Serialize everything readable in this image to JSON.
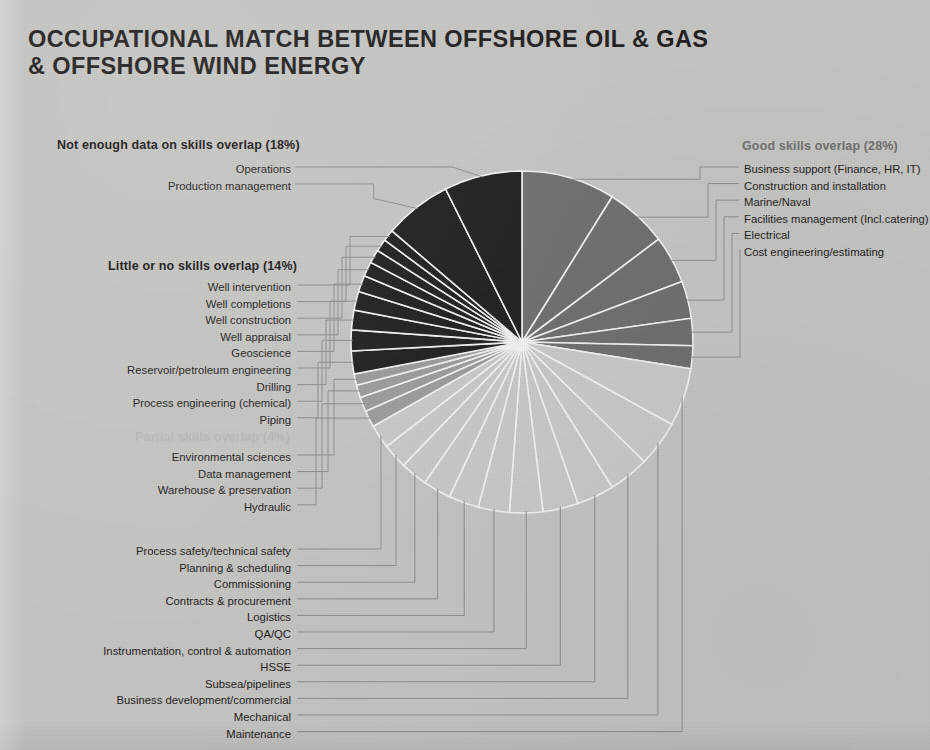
{
  "title": {
    "line1": "OCCUPATIONAL MATCH BETWEEN OFFSHORE OIL & GAS",
    "line2": "& OFFSHORE WIND ENERGY"
  },
  "colors": {
    "background": "#c4c4c2",
    "not_enough_data": "#1e1c1c",
    "good_overlap": "#6e6e6e",
    "partial_overlap": "#9b9b9a",
    "little_or_no": "#1e1c1c",
    "default_slice": "#c9c9c7",
    "slice_divider": "#f2f2f0",
    "leader_line": "#8d8d8b",
    "title_text": "#1d1b1b"
  },
  "groups": {
    "not_enough_data": {
      "heading": "Not enough data on skills overlap (18%)",
      "percent": 18,
      "items": [
        "Operations",
        "Production management"
      ]
    },
    "little_or_no": {
      "heading": "Little or no skills overlap (14%)",
      "percent": 14,
      "items": [
        "Well intervention",
        "Well completions",
        "Well construction",
        "Well appraisal",
        "Geoscience",
        "Reservoir/petroleum engineering",
        "Drilling",
        "Process engineering (chemical)",
        "Piping"
      ]
    },
    "partial": {
      "heading": "Partial skills overlap (4%)",
      "percent": 4,
      "items": [
        "Environmental sciences",
        "Data management",
        "Warehouse & preservation",
        "Hydraulic"
      ]
    },
    "good": {
      "heading": "Good skills overlap (28%)",
      "percent": 28,
      "items": [
        "Business support (Finance, HR, IT)",
        "Construction and installation",
        "Marine/Naval",
        "Facilities management (Incl.catering)",
        "Electrical",
        "Cost engineering/estimating"
      ]
    },
    "bottom": {
      "heading": "",
      "items": [
        "Process safety/technical safety",
        "Planning & scheduling",
        "Commissioning",
        "Contracts & procurement",
        "Logistics",
        "QA/QC",
        "Instrumentation, control & automation",
        "HSSE",
        "Subsea/pipelines",
        "Business development/commercial",
        "Mechanical",
        "Maintenance"
      ]
    }
  },
  "chart_data": {
    "type": "pie",
    "title": "Occupational match between offshore oil & gas & offshore wind energy",
    "legend_position": "around",
    "grid": false,
    "center": [
      522,
      342
    ],
    "radius": 171,
    "start_angle_deg": -90,
    "direction": "clockwise",
    "categories": [
      "Business support (Finance, HR, IT)",
      "Construction and installation",
      "Marine/Naval",
      "Facilities management (Incl.catering)",
      "Electrical",
      "Cost engineering/estimating",
      "Maintenance",
      "Mechanical",
      "Business development/commercial",
      "Subsea/pipelines",
      "HSSE",
      "Instrumentation, control & automation",
      "QA/QC",
      "Logistics",
      "Contracts & procurement",
      "Commissioning",
      "Planning & scheduling",
      "Process safety/technical safety",
      "Hydraulic",
      "Warehouse & preservation",
      "Data management",
      "Environmental sciences",
      "Piping",
      "Process engineering (chemical)",
      "Drilling",
      "Reservoir/petroleum engineering",
      "Geoscience",
      "Well appraisal",
      "Well construction",
      "Well completions",
      "Well intervention",
      "Production management",
      "Operations"
    ],
    "values": [
      9.0,
      6.0,
      4.6,
      3.6,
      2.6,
      2.2,
      5.6,
      4.4,
      3.9,
      3.6,
      3.4,
      3.2,
      3.0,
      2.9,
      2.7,
      2.6,
      2.4,
      2.3,
      1.6,
      1.4,
      1.2,
      1.1,
      2.2,
      2.0,
      1.9,
      1.8,
      1.6,
      1.4,
      1.3,
      1.2,
      1.1,
      6.5,
      7.5
    ],
    "group_of_slice": [
      "good",
      "good",
      "good",
      "good",
      "good",
      "good",
      "default",
      "default",
      "default",
      "default",
      "default",
      "default",
      "default",
      "default",
      "default",
      "default",
      "default",
      "default",
      "partial",
      "partial",
      "partial",
      "partial",
      "little",
      "little",
      "little",
      "little",
      "little",
      "little",
      "little",
      "little",
      "little",
      "notenough",
      "notenough"
    ],
    "group_totals": {
      "Good skills overlap": 28,
      "Not enough data on skills overlap": 18,
      "Little or no skills overlap": 14,
      "Partial skills overlap": 4
    }
  }
}
